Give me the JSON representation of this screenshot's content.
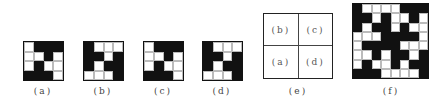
{
  "panels": [
    {
      "id": "a",
      "label": "(a)",
      "size": 4,
      "grid": [
        [
          0,
          1,
          1,
          1
        ],
        [
          0,
          0,
          1,
          0
        ],
        [
          0,
          1,
          0,
          0
        ],
        [
          1,
          1,
          1,
          0
        ]
      ]
    },
    {
      "id": "b",
      "label": "(b)",
      "size": 4,
      "grid": [
        [
          1,
          0,
          0,
          0
        ],
        [
          1,
          1,
          0,
          1
        ],
        [
          1,
          0,
          1,
          1
        ],
        [
          0,
          0,
          0,
          1
        ]
      ]
    },
    {
      "id": "c",
      "label": "(c)",
      "size": 4,
      "grid": [
        [
          0,
          1,
          1,
          1
        ],
        [
          0,
          0,
          1,
          0
        ],
        [
          0,
          1,
          0,
          0
        ],
        [
          1,
          1,
          1,
          0
        ]
      ]
    },
    {
      "id": "d",
      "label": "(d)",
      "size": 4,
      "grid": [
        [
          1,
          0,
          0,
          0
        ],
        [
          1,
          1,
          0,
          1
        ],
        [
          1,
          0,
          1,
          1
        ],
        [
          0,
          0,
          0,
          1
        ]
      ]
    }
  ],
  "layout_panel": {
    "label": "(e)",
    "quadrants": {
      "top_left": "(b)",
      "top_right": "(c)",
      "bottom_left": "(a)",
      "bottom_right": "(d)"
    }
  },
  "composite_panel": {
    "label": "(f)",
    "size": 8,
    "grid": [
      [
        1,
        0,
        0,
        0,
        0,
        1,
        1,
        1
      ],
      [
        1,
        1,
        0,
        1,
        0,
        0,
        1,
        0
      ],
      [
        1,
        0,
        1,
        1,
        0,
        1,
        0,
        0
      ],
      [
        0,
        0,
        0,
        1,
        1,
        1,
        1,
        0
      ],
      [
        0,
        1,
        1,
        1,
        1,
        0,
        0,
        0
      ],
      [
        0,
        0,
        1,
        0,
        1,
        1,
        0,
        1
      ],
      [
        0,
        1,
        0,
        0,
        1,
        0,
        1,
        1
      ],
      [
        1,
        1,
        1,
        0,
        0,
        0,
        0,
        1
      ]
    ]
  },
  "colors": {
    "black": "#111111",
    "white": "#ffffff",
    "grid_line": "#bbbbbb"
  }
}
